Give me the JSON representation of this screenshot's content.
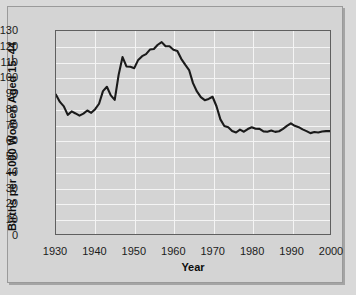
{
  "chart_data": {
    "type": "line",
    "title": "",
    "xlabel": "Year",
    "ylabel": "Births per 1,000 Women Aged 15–44",
    "xlim": [
      1930,
      2000
    ],
    "ylim": [
      0,
      130
    ],
    "xticks": [
      1930,
      1940,
      1950,
      1960,
      1970,
      1980,
      1990,
      2000
    ],
    "yticks": [
      0,
      10,
      20,
      30,
      40,
      50,
      60,
      70,
      80,
      90,
      100,
      110,
      120,
      130
    ],
    "grid": true,
    "legend": "none",
    "series": [
      {
        "name": "General fertility rate",
        "color": "#1a1a1a",
        "x": [
          1930,
          1931,
          1932,
          1933,
          1934,
          1935,
          1936,
          1937,
          1938,
          1939,
          1940,
          1941,
          1942,
          1943,
          1944,
          1945,
          1946,
          1947,
          1948,
          1949,
          1950,
          1951,
          1952,
          1953,
          1954,
          1955,
          1956,
          1957,
          1958,
          1959,
          1960,
          1961,
          1962,
          1963,
          1964,
          1965,
          1966,
          1967,
          1968,
          1969,
          1970,
          1971,
          1972,
          1973,
          1974,
          1975,
          1976,
          1977,
          1978,
          1979,
          1980,
          1981,
          1982,
          1983,
          1984,
          1985,
          1986,
          1987,
          1988,
          1989,
          1990,
          1991,
          1992,
          1993,
          1994,
          1995,
          1996,
          1997,
          1998,
          1999,
          2000
        ],
        "values": [
          89.2,
          84.6,
          81.7,
          76.3,
          78.5,
          77.2,
          75.8,
          77.1,
          79.1,
          77.6,
          79.9,
          83.4,
          91.5,
          94.3,
          88.8,
          85.9,
          101.9,
          113.3,
          107.3,
          107.1,
          106.2,
          111.5,
          113.9,
          115.2,
          118.1,
          118.5,
          121.2,
          122.9,
          120.2,
          120.2,
          118.0,
          117.2,
          112.2,
          108.5,
          105.0,
          96.6,
          91.3,
          87.6,
          85.7,
          86.5,
          87.9,
          81.8,
          73.4,
          69.2,
          68.4,
          66.0,
          65.0,
          66.8,
          65.5,
          67.2,
          68.4,
          67.4,
          67.3,
          65.7,
          65.5,
          66.3,
          65.4,
          65.8,
          67.3,
          69.2,
          70.9,
          69.3,
          68.4,
          67.0,
          65.9,
          64.6,
          65.3,
          65.0,
          65.6,
          65.9,
          65.9
        ]
      }
    ]
  },
  "figure": {
    "plot_background": "#d4d4d4",
    "gridline_color": "#f4f4f4",
    "line_color": "#1a1a1a",
    "frame_color": "#9a9a9a"
  }
}
